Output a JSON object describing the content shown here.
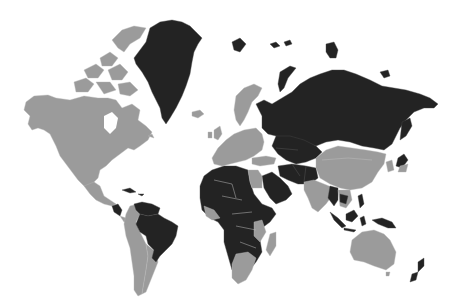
{
  "map": {
    "type": "world-choropleth",
    "projection": "mercator",
    "background_color": "#ffffff",
    "categories": [
      {
        "name": "highlighted",
        "color": "#232323"
      },
      {
        "name": "other",
        "color": "#9b9b9b"
      }
    ],
    "highlighted_regions": [
      "Greenland",
      "Russia",
      "Kazakhstan",
      "Central Asia",
      "Iran",
      "Afghanistan",
      "Pakistan",
      "Arabian Peninsula",
      "North Africa (excluding Egypt)",
      "Sub-Saharan Africa (most)",
      "Brazil",
      "Venezuela / Guianas",
      "Central America (part)",
      "Cuba",
      "Myanmar",
      "Cambodia / Laos",
      "Indonesia",
      "Papua New Guinea",
      "Philippines (part)",
      "Japan (part)",
      "New Zealand",
      "Svalbard",
      "Novaya Zemlya",
      "Franz Josef Land",
      "New Siberian Islands"
    ],
    "other_regions": [
      "Canada",
      "United States",
      "Mexico",
      "Alaska",
      "Andean South America",
      "Argentina",
      "Chile",
      "Europe",
      "Scandinavia",
      "Iceland",
      "Egypt",
      "Turkey",
      "China",
      "Mongolia",
      "India",
      "Southern Africa",
      "Madagascar",
      "Australia",
      "Thailand / Vietnam",
      "Korea"
    ]
  }
}
